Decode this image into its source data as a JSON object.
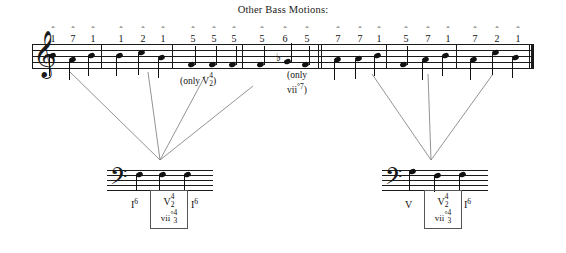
{
  "title": "Other Bass Motions:",
  "treble_staff": {
    "clef": "treble-clef",
    "clef_glyph": "𝄞",
    "measures": [
      {
        "degrees": [
          {
            "caret": "ˆ",
            "num": "1"
          },
          {
            "caret": "ˆ",
            "num": "7"
          },
          {
            "caret": "ˆ",
            "num": "1"
          }
        ]
      },
      {
        "degrees": [
          {
            "caret": "ˆ",
            "num": "1"
          },
          {
            "caret": "ˆ",
            "num": "2"
          },
          {
            "caret": "ˆ",
            "num": "1"
          }
        ]
      },
      {
        "degrees": [
          {
            "caret": "ˆ",
            "num": "5"
          },
          {
            "caret": "ˆ",
            "num": "5"
          },
          {
            "caret": "ˆ",
            "num": "5"
          }
        ]
      },
      {
        "degrees": [
          {
            "caret": "ˆ",
            "num": "5"
          },
          {
            "caret": "ˆ",
            "num": "6"
          },
          {
            "caret": "ˆ",
            "num": "5"
          }
        ]
      },
      {
        "degrees": [
          {
            "caret": "ˆ",
            "num": "7"
          },
          {
            "caret": "ˆ",
            "num": "7"
          },
          {
            "caret": "ˆ",
            "num": "1"
          }
        ]
      },
      {
        "degrees": [
          {
            "caret": "ˆ",
            "num": "5"
          },
          {
            "caret": "ˆ",
            "num": "7"
          },
          {
            "caret": "ˆ",
            "num": "1"
          }
        ]
      },
      {
        "degrees": [
          {
            "caret": "ˆ",
            "num": "7"
          },
          {
            "caret": "ˆ",
            "num": "2"
          },
          {
            "caret": "ˆ",
            "num": "1"
          }
        ]
      }
    ],
    "accidental_flat": "♭"
  },
  "annotations": {
    "only_v42": {
      "prefix": "(only V",
      "frac_top": "4",
      "frac_bottom": "2",
      "suffix": ")"
    },
    "only_vii07": {
      "line1": "(only",
      "line2_base": "vii",
      "line2_dim": "°",
      "line2_sup": "7",
      "line2_close": ")"
    }
  },
  "bass_left": {
    "clef": "bass-clef",
    "clef_glyph": "𝄢",
    "roman_before": "I",
    "roman_before_sup": "6",
    "roman_after": "I",
    "roman_after_sup": "6",
    "box": {
      "top_base": "V",
      "top_frac_top": "4",
      "top_frac_bottom": "2",
      "bottom_base": "vii",
      "bottom_dim": "°",
      "bottom_frac_top": "4",
      "bottom_frac_bottom": "3"
    }
  },
  "bass_right": {
    "clef": "bass-clef",
    "clef_glyph": "𝄢",
    "roman_before": "V",
    "roman_before_sup": "",
    "roman_after": "I",
    "roman_after_sup": "6",
    "box": {
      "top_base": "V",
      "top_frac_top": "4",
      "top_frac_bottom": "2",
      "bottom_base": "vii",
      "bottom_dim": "°",
      "bottom_frac_top": "4",
      "bottom_frac_bottom": "3"
    }
  },
  "colors": {
    "ink": "#111111",
    "connector": "#777777",
    "box_border": "#555555"
  }
}
